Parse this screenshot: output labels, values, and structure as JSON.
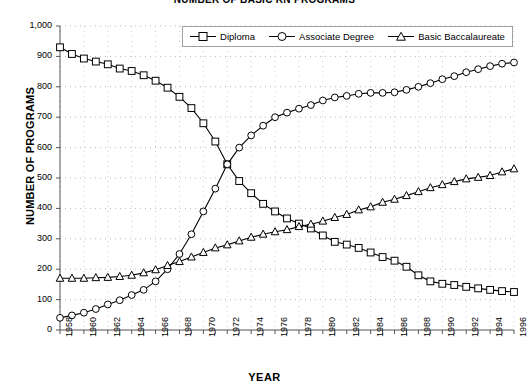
{
  "chart_data": {
    "type": "line",
    "title": "NUMBER OF BASIC RN PROGRAMS",
    "xlabel": "YEAR",
    "ylabel": "NUMBER OF PROGRAMS",
    "xlim": [
      1958,
      1996
    ],
    "ylim": [
      0,
      1000
    ],
    "ytick_step": 100,
    "grid": true,
    "grid_style": "dotted",
    "legend_position": "top-center",
    "x": [
      1958,
      1959,
      1960,
      1961,
      1962,
      1963,
      1964,
      1965,
      1966,
      1967,
      1968,
      1969,
      1970,
      1971,
      1972,
      1973,
      1974,
      1975,
      1976,
      1977,
      1978,
      1979,
      1980,
      1981,
      1982,
      1983,
      1984,
      1985,
      1986,
      1987,
      1988,
      1989,
      1990,
      1991,
      1992,
      1993,
      1994,
      1995,
      1996
    ],
    "x_tick_labels": [
      "1958",
      "1960",
      "1962",
      "1964",
      "1966",
      "1968",
      "1970",
      "1972",
      "1974",
      "1976",
      "1978",
      "1980",
      "1982",
      "1984",
      "1986",
      "1988",
      "1990",
      "1992",
      "1994",
      "1996"
    ],
    "y_tick_labels": [
      "0",
      "100",
      "200",
      "300",
      "400",
      "500",
      "600",
      "700",
      "800",
      "900",
      "1,000"
    ],
    "series": [
      {
        "name": "Diploma",
        "marker": "square",
        "color": "#000000",
        "values": [
          930,
          908,
          893,
          883,
          874,
          860,
          852,
          838,
          820,
          797,
          767,
          730,
          680,
          620,
          545,
          490,
          450,
          415,
          390,
          367,
          350,
          334,
          311,
          290,
          281,
          270,
          255,
          240,
          228,
          208,
          180,
          160,
          152,
          148,
          142,
          137,
          132,
          128,
          125
        ]
      },
      {
        "name": "Associate Degree",
        "marker": "circle",
        "color": "#000000",
        "values": [
          40,
          48,
          57,
          69,
          84,
          98,
          115,
          132,
          160,
          200,
          250,
          315,
          390,
          465,
          545,
          600,
          640,
          672,
          700,
          715,
          728,
          740,
          755,
          765,
          770,
          777,
          780,
          780,
          782,
          790,
          800,
          812,
          825,
          835,
          848,
          858,
          868,
          876,
          880
        ]
      },
      {
        "name": "Basic Baccalaureate",
        "marker": "triangle",
        "color": "#000000",
        "values": [
          170,
          170,
          170,
          172,
          173,
          176,
          180,
          188,
          198,
          212,
          225,
          240,
          255,
          270,
          280,
          293,
          305,
          315,
          323,
          330,
          340,
          348,
          358,
          370,
          380,
          395,
          405,
          420,
          430,
          442,
          455,
          468,
          478,
          488,
          497,
          502,
          508,
          520,
          530
        ]
      }
    ]
  }
}
